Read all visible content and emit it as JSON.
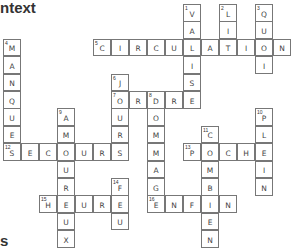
{
  "heading_top": "ntext",
  "heading_bottom": "s",
  "grid": {
    "cell_w": 18,
    "cell_h": 17.4,
    "origin_x": 3,
    "origin_y": 4
  },
  "words": [
    {
      "num": "1",
      "dir": "down",
      "answer": "VALISE",
      "col": 10,
      "row": 0
    },
    {
      "num": "2",
      "dir": "down",
      "answer": "LIT",
      "col": 12,
      "row": 0
    },
    {
      "num": "3",
      "dir": "down",
      "answer": "QUOI",
      "col": 14,
      "row": 0
    },
    {
      "num": "4",
      "dir": "down",
      "answer": "MANQUE",
      "col": 0,
      "row": 2
    },
    {
      "num": "5",
      "dir": "across",
      "answer": "CIRCULATION",
      "col": 5,
      "row": 2
    },
    {
      "num": "6",
      "dir": "down",
      "answer": "JOURS",
      "col": 6,
      "row": 4
    },
    {
      "num": "7",
      "dir": "across",
      "answer": "ORDRE",
      "col": 6,
      "row": 5
    },
    {
      "num": "8",
      "dir": "down",
      "answer": "DOMMAGE",
      "col": 8,
      "row": 5
    },
    {
      "num": "9",
      "dir": "down",
      "answer": "AMOUREUX",
      "col": 3,
      "row": 6
    },
    {
      "num": "10",
      "dir": "down",
      "answer": "PLEIN",
      "col": 14,
      "row": 6
    },
    {
      "num": "11",
      "dir": "down",
      "answer": "COMBIEN",
      "col": 11,
      "row": 7
    },
    {
      "num": "12",
      "dir": "across",
      "answer": "SECOURS",
      "col": 0,
      "row": 8
    },
    {
      "num": "13",
      "dir": "across",
      "answer": "POCHE",
      "col": 10,
      "row": 8
    },
    {
      "num": "14",
      "dir": "down",
      "answer": "FEU",
      "col": 6,
      "row": 10
    },
    {
      "num": "15",
      "dir": "across",
      "answer": "HEURE",
      "col": 2,
      "row": 11
    },
    {
      "num": "16",
      "dir": "across",
      "answer": "ENFIN",
      "col": 8,
      "row": 11
    }
  ]
}
